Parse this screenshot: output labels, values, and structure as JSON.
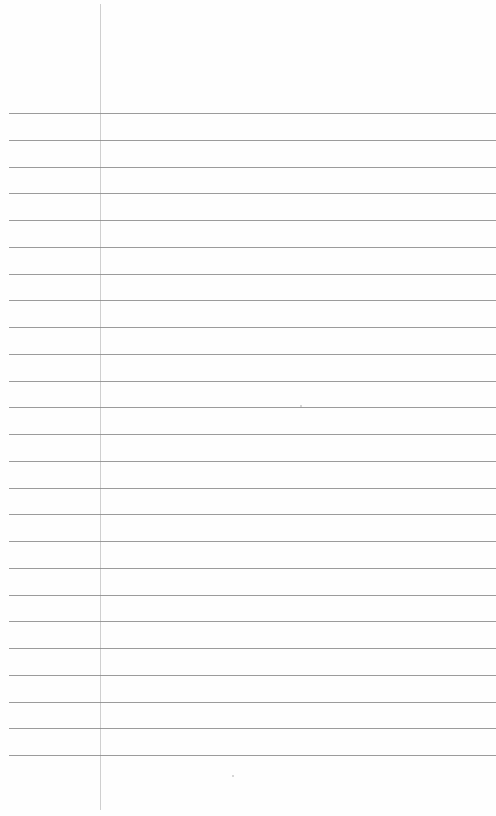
{
  "page": {
    "type": "lined-notebook-paper",
    "background_color": "#fefefe",
    "rule_color": "#8a8a8a",
    "margin_color": "#cfcfcf",
    "rules": {
      "count": 25,
      "first_y": 113,
      "spacing": 26.75
    },
    "margin_x": 100
  }
}
